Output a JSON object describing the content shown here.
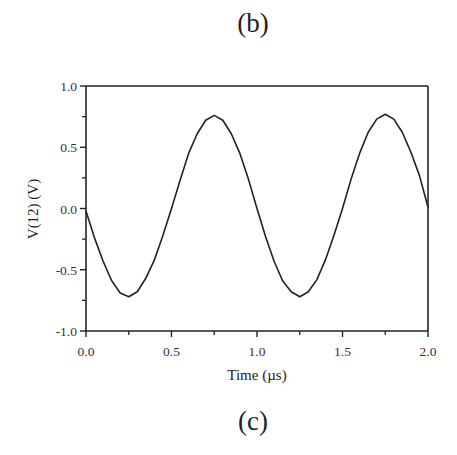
{
  "figure": {
    "top_label": "(b)",
    "bottom_label": "(c)"
  },
  "chart_data": {
    "type": "line",
    "title": "",
    "xlabel": "Time (µs)",
    "ylabel": "V(12)  (V)",
    "xlim": [
      0.0,
      2.0
    ],
    "ylim": [
      -1.0,
      1.0
    ],
    "xticks": [
      0.0,
      0.5,
      1.0,
      1.5,
      2.0
    ],
    "xtick_labels": [
      "0.0",
      "0.5",
      "1.0",
      "1.5",
      "2.0"
    ],
    "yticks": [
      -1.0,
      -0.5,
      0.0,
      0.5,
      1.0
    ],
    "ytick_labels": [
      "-1.0",
      "-0.5",
      "0.0",
      "0.5",
      "1.0"
    ],
    "minor_xticks": [
      0.25,
      0.75,
      1.25,
      1.75
    ],
    "minor_yticks": [
      -0.75,
      -0.25,
      0.25,
      0.75
    ],
    "grid": false,
    "legend": null,
    "series": [
      {
        "name": "V(12)",
        "color": "#222222",
        "x": [
          0.0,
          0.05,
          0.1,
          0.15,
          0.2,
          0.25,
          0.3,
          0.35,
          0.4,
          0.45,
          0.5,
          0.55,
          0.6,
          0.65,
          0.7,
          0.75,
          0.8,
          0.85,
          0.9,
          0.95,
          1.0,
          1.05,
          1.1,
          1.15,
          1.2,
          1.25,
          1.3,
          1.35,
          1.4,
          1.45,
          1.5,
          1.55,
          1.6,
          1.65,
          1.7,
          1.75,
          1.8,
          1.85,
          1.9,
          1.95,
          2.0
        ],
        "y": [
          -0.02,
          -0.24,
          -0.43,
          -0.59,
          -0.69,
          -0.72,
          -0.68,
          -0.57,
          -0.42,
          -0.22,
          0.0,
          0.23,
          0.45,
          0.61,
          0.72,
          0.76,
          0.72,
          0.61,
          0.45,
          0.24,
          0.0,
          -0.23,
          -0.43,
          -0.59,
          -0.68,
          -0.72,
          -0.68,
          -0.58,
          -0.42,
          -0.22,
          0.0,
          0.24,
          0.45,
          0.62,
          0.73,
          0.77,
          0.73,
          0.62,
          0.46,
          0.27,
          0.01
        ]
      }
    ]
  }
}
